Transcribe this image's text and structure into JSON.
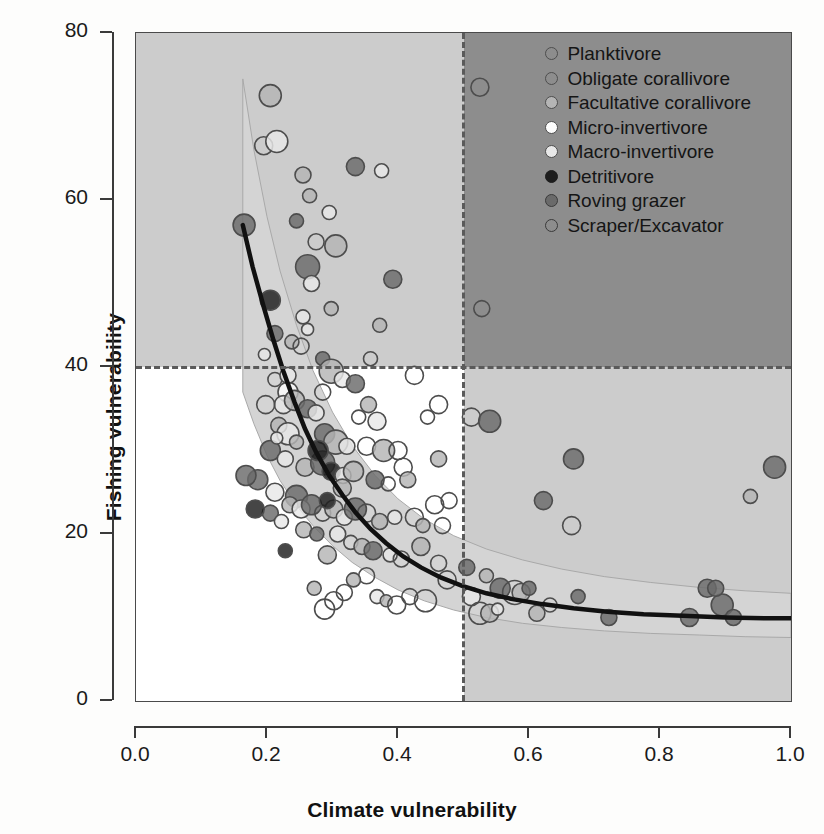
{
  "chart_data": {
    "type": "scatter",
    "title": "",
    "xlabel": "Climate vulnerability",
    "ylabel": "Fishing vulnerability",
    "xlim": [
      0.0,
      1.0
    ],
    "ylim": [
      0,
      80
    ],
    "xticks": [
      "0.0",
      "0.2",
      "0.4",
      "0.6",
      "0.8",
      "1.0"
    ],
    "xtick_values": [
      0.0,
      0.2,
      0.4,
      0.6,
      0.8,
      1.0
    ],
    "yticks": [
      "0",
      "20",
      "40",
      "60",
      "80"
    ],
    "ytick_values": [
      0,
      20,
      40,
      60,
      80
    ],
    "grid": false,
    "legend_position": "top-right",
    "annotations": {
      "threshold_x": 0.5,
      "threshold_y": 40,
      "quadrant_shading": {
        "top_left": "#cccccc",
        "top_right": "#8d8d8d",
        "bottom_left": "#ffffff",
        "bottom_right": "#cccccc"
      }
    },
    "fit_curve": {
      "name": "fitted trend",
      "color": "#111111",
      "points": [
        [
          0.163,
          57.0
        ],
        [
          0.178,
          52.0
        ],
        [
          0.195,
          47.2
        ],
        [
          0.21,
          43.2
        ],
        [
          0.225,
          39.5
        ],
        [
          0.242,
          35.8
        ],
        [
          0.258,
          32.6
        ],
        [
          0.275,
          29.8
        ],
        [
          0.295,
          27.0
        ],
        [
          0.315,
          24.7
        ],
        [
          0.335,
          22.6
        ],
        [
          0.358,
          20.6
        ],
        [
          0.382,
          18.9
        ],
        [
          0.408,
          17.3
        ],
        [
          0.435,
          16.0
        ],
        [
          0.465,
          14.8
        ],
        [
          0.498,
          13.8
        ],
        [
          0.535,
          12.9
        ],
        [
          0.575,
          12.2
        ],
        [
          0.62,
          11.6
        ],
        [
          0.668,
          11.1
        ],
        [
          0.72,
          10.7
        ],
        [
          0.775,
          10.4
        ],
        [
          0.835,
          10.2
        ],
        [
          0.9,
          10.0
        ],
        [
          0.965,
          9.9
        ],
        [
          1.0,
          9.9
        ]
      ]
    },
    "confidence_band": {
      "name": "95% confidence band",
      "color": "#d4d4d4",
      "upper": [
        [
          0.163,
          74.5
        ],
        [
          0.18,
          66.0
        ],
        [
          0.2,
          58.0
        ],
        [
          0.22,
          51.5
        ],
        [
          0.245,
          45.0
        ],
        [
          0.27,
          39.6
        ],
        [
          0.3,
          34.6
        ],
        [
          0.33,
          30.6
        ],
        [
          0.365,
          27.0
        ],
        [
          0.4,
          24.2
        ],
        [
          0.44,
          21.8
        ],
        [
          0.485,
          19.8
        ],
        [
          0.535,
          18.2
        ],
        [
          0.59,
          16.9
        ],
        [
          0.65,
          15.8
        ],
        [
          0.715,
          14.9
        ],
        [
          0.785,
          14.2
        ],
        [
          0.86,
          13.6
        ],
        [
          0.93,
          13.2
        ],
        [
          1.0,
          12.9
        ]
      ],
      "lower": [
        [
          1.0,
          7.6
        ],
        [
          0.93,
          7.7
        ],
        [
          0.86,
          7.9
        ],
        [
          0.785,
          8.1
        ],
        [
          0.715,
          8.4
        ],
        [
          0.65,
          8.8
        ],
        [
          0.59,
          9.3
        ],
        [
          0.535,
          10.0
        ],
        [
          0.485,
          10.9
        ],
        [
          0.44,
          12.0
        ],
        [
          0.4,
          13.3
        ],
        [
          0.365,
          14.8
        ],
        [
          0.33,
          16.6
        ],
        [
          0.3,
          18.6
        ],
        [
          0.27,
          21.0
        ],
        [
          0.245,
          23.4
        ],
        [
          0.22,
          26.4
        ],
        [
          0.2,
          29.4
        ],
        [
          0.18,
          33.2
        ],
        [
          0.163,
          37.0
        ]
      ]
    },
    "groups": [
      {
        "name": "Planktivore",
        "fill": "#ffffff",
        "stroke": "#4d4d4d"
      },
      {
        "name": "Obligate corallivore",
        "fill": "#f2f2f2",
        "stroke": "#4d4d4d"
      },
      {
        "name": "Facultative corallivore",
        "fill": "#b5b5b5",
        "stroke": "#4d4d4d"
      },
      {
        "name": "Micro-invertivore",
        "fill": "#fcfcfc",
        "stroke": "#4d4d4d"
      },
      {
        "name": "Macro-invertivore",
        "fill": "#e8e8e8",
        "stroke": "#4d4d4d"
      },
      {
        "name": "Detritivore",
        "fill": "#1d1d1d",
        "stroke": "#1d1d1d"
      },
      {
        "name": "Roving grazer",
        "fill": "#6a6a6a",
        "stroke": "#3a3a3a"
      },
      {
        "name": "Scraper/Excavator",
        "fill": "#ffffff",
        "stroke": "#3a3a3a"
      }
    ],
    "points": [
      [
        0.205,
        72.5,
        11,
        2
      ],
      [
        0.525,
        73.5,
        9,
        0
      ],
      [
        0.195,
        66.5,
        9,
        7
      ],
      [
        0.215,
        67.0,
        11,
        4
      ],
      [
        0.255,
        63.0,
        8,
        2
      ],
      [
        0.335,
        64.0,
        9,
        6
      ],
      [
        0.165,
        57.0,
        11,
        6
      ],
      [
        0.375,
        63.5,
        7,
        4
      ],
      [
        0.265,
        60.5,
        7,
        2
      ],
      [
        0.295,
        58.5,
        7,
        4
      ],
      [
        0.275,
        55.0,
        8,
        0
      ],
      [
        0.305,
        54.5,
        11,
        2
      ],
      [
        0.262,
        52.0,
        12,
        6
      ],
      [
        0.268,
        50.0,
        8,
        4
      ],
      [
        0.392,
        50.5,
        9,
        6
      ],
      [
        0.205,
        48.0,
        10,
        5
      ],
      [
        0.298,
        47.0,
        7,
        2
      ],
      [
        0.255,
        46.0,
        7,
        4
      ],
      [
        0.528,
        47.0,
        8,
        7
      ],
      [
        0.212,
        44.0,
        8,
        6
      ],
      [
        0.238,
        43.0,
        7,
        2
      ],
      [
        0.196,
        41.5,
        6,
        4
      ],
      [
        0.252,
        42.5,
        8,
        0
      ],
      [
        0.285,
        41.0,
        7,
        6
      ],
      [
        0.298,
        39.5,
        12,
        2
      ],
      [
        0.315,
        38.5,
        8,
        4
      ],
      [
        0.285,
        37.0,
        8,
        0
      ],
      [
        0.335,
        38.0,
        9,
        6
      ],
      [
        0.425,
        39.0,
        9,
        0
      ],
      [
        0.232,
        37.0,
        10,
        3
      ],
      [
        0.225,
        35.5,
        9,
        4
      ],
      [
        0.242,
        36.0,
        10,
        2
      ],
      [
        0.262,
        35.0,
        9,
        6
      ],
      [
        0.275,
        34.5,
        8,
        4
      ],
      [
        0.34,
        34.0,
        7,
        0
      ],
      [
        0.355,
        35.5,
        8,
        2
      ],
      [
        0.368,
        33.5,
        9,
        4
      ],
      [
        0.462,
        35.5,
        9,
        0
      ],
      [
        0.512,
        34.0,
        9,
        7
      ],
      [
        0.54,
        33.5,
        11,
        6
      ],
      [
        0.218,
        33.0,
        8,
        2
      ],
      [
        0.232,
        32.0,
        11,
        4
      ],
      [
        0.288,
        32.0,
        10,
        6
      ],
      [
        0.305,
        31.0,
        12,
        2
      ],
      [
        0.322,
        30.5,
        8,
        4
      ],
      [
        0.352,
        30.5,
        9,
        0
      ],
      [
        0.378,
        30.0,
        11,
        2
      ],
      [
        0.4,
        30.0,
        9,
        7
      ],
      [
        0.408,
        28.0,
        9,
        0
      ],
      [
        0.975,
        28.0,
        11,
        6
      ],
      [
        0.205,
        30.0,
        10,
        6
      ],
      [
        0.228,
        29.0,
        8,
        4
      ],
      [
        0.258,
        28.0,
        9,
        2
      ],
      [
        0.285,
        28.5,
        12,
        6
      ],
      [
        0.298,
        27.5,
        9,
        5
      ],
      [
        0.316,
        27.0,
        8,
        4
      ],
      [
        0.332,
        27.5,
        10,
        2
      ],
      [
        0.365,
        26.5,
        9,
        6
      ],
      [
        0.385,
        26.0,
        7,
        0
      ],
      [
        0.415,
        26.5,
        8,
        2
      ],
      [
        0.186,
        26.5,
        10,
        6
      ],
      [
        0.212,
        25.0,
        9,
        4
      ],
      [
        0.245,
        24.5,
        11,
        6
      ],
      [
        0.668,
        29.0,
        10,
        6
      ],
      [
        0.622,
        24.0,
        9,
        6
      ],
      [
        0.938,
        24.5,
        7,
        2
      ],
      [
        0.235,
        23.5,
        8,
        2
      ],
      [
        0.252,
        23.0,
        9,
        4
      ],
      [
        0.268,
        23.5,
        10,
        6
      ],
      [
        0.285,
        22.5,
        8,
        0
      ],
      [
        0.302,
        23.0,
        9,
        2
      ],
      [
        0.318,
        22.0,
        8,
        4
      ],
      [
        0.335,
        23.0,
        11,
        6
      ],
      [
        0.352,
        22.5,
        9,
        0
      ],
      [
        0.372,
        21.5,
        8,
        2
      ],
      [
        0.395,
        22.0,
        7,
        4
      ],
      [
        0.425,
        22.0,
        9,
        0
      ],
      [
        0.456,
        23.5,
        9,
        7
      ],
      [
        0.468,
        21.0,
        8,
        0
      ],
      [
        0.205,
        22.5,
        8,
        6
      ],
      [
        0.222,
        21.5,
        7,
        4
      ],
      [
        0.256,
        20.5,
        8,
        2
      ],
      [
        0.276,
        20.0,
        7,
        6
      ],
      [
        0.292,
        17.5,
        9,
        2
      ],
      [
        0.308,
        20.0,
        8,
        4
      ],
      [
        0.328,
        19.0,
        7,
        0
      ],
      [
        0.345,
        18.5,
        8,
        2
      ],
      [
        0.362,
        18.0,
        9,
        6
      ],
      [
        0.388,
        17.5,
        7,
        4
      ],
      [
        0.405,
        17.0,
        8,
        0
      ],
      [
        0.435,
        18.5,
        9,
        2
      ],
      [
        0.462,
        16.5,
        8,
        0
      ],
      [
        0.475,
        14.5,
        9,
        0
      ],
      [
        0.505,
        16.0,
        8,
        6
      ],
      [
        0.535,
        15.0,
        7,
        2
      ],
      [
        0.556,
        13.5,
        10,
        6
      ],
      [
        0.578,
        13.0,
        12,
        0
      ],
      [
        0.588,
        13.0,
        9,
        2
      ],
      [
        0.6,
        13.5,
        7,
        6
      ],
      [
        0.512,
        12.5,
        9,
        4
      ],
      [
        0.525,
        10.5,
        11,
        0
      ],
      [
        0.54,
        10.5,
        9,
        2
      ],
      [
        0.552,
        11.0,
        6,
        4
      ],
      [
        0.612,
        10.5,
        8,
        2
      ],
      [
        0.632,
        11.5,
        7,
        0
      ],
      [
        0.665,
        21.0,
        9,
        0
      ],
      [
        0.675,
        12.5,
        7,
        6
      ],
      [
        0.722,
        10.0,
        8,
        6
      ],
      [
        0.845,
        10.0,
        9,
        6
      ],
      [
        0.872,
        13.5,
        9,
        6
      ],
      [
        0.895,
        11.5,
        11,
        6
      ],
      [
        0.885,
        13.5,
        8,
        6
      ],
      [
        0.912,
        10.0,
        8,
        6
      ],
      [
        0.352,
        15.0,
        8,
        0
      ],
      [
        0.332,
        14.5,
        7,
        2
      ],
      [
        0.318,
        13.0,
        8,
        0
      ],
      [
        0.302,
        12.0,
        9,
        0
      ],
      [
        0.288,
        11.0,
        10,
        0
      ],
      [
        0.368,
        12.5,
        7,
        4
      ],
      [
        0.382,
        12.0,
        6,
        2
      ],
      [
        0.398,
        11.5,
        9,
        0
      ],
      [
        0.418,
        12.5,
        8,
        0
      ],
      [
        0.442,
        12.0,
        11,
        0
      ],
      [
        0.272,
        13.5,
        7,
        2
      ],
      [
        0.245,
        31.0,
        7,
        2
      ],
      [
        0.228,
        18.0,
        7,
        5
      ],
      [
        0.212,
        38.5,
        7,
        0
      ],
      [
        0.262,
        44.5,
        6,
        4
      ],
      [
        0.198,
        35.5,
        9,
        0
      ],
      [
        0.215,
        31.5,
        6,
        4
      ],
      [
        0.182,
        23.0,
        9,
        5
      ],
      [
        0.168,
        27.0,
        10,
        6
      ],
      [
        0.445,
        34.0,
        7,
        0
      ],
      [
        0.462,
        29.0,
        8,
        2
      ],
      [
        0.478,
        24.0,
        8,
        0
      ],
      [
        0.438,
        21.0,
        7,
        2
      ],
      [
        0.358,
        41.0,
        7,
        0
      ],
      [
        0.372,
        45.0,
        7,
        2
      ],
      [
        0.245,
        57.5,
        7,
        6
      ],
      [
        0.232,
        39.0,
        8,
        4
      ],
      [
        0.292,
        24.0,
        8,
        5
      ],
      [
        0.315,
        25.5,
        9,
        2
      ],
      [
        0.278,
        30.0,
        10,
        5
      ]
    ]
  },
  "legend": {
    "items": [
      "Planktivore",
      "Obligate corallivore",
      "Facultative corallivore",
      "Micro-invertivore",
      "Macro-invertivore",
      "Detritivore",
      "Roving grazer",
      "Scraper/Excavator"
    ]
  },
  "axes": {
    "x_title": "Climate vulnerability",
    "y_title": "Fishing vulnerability"
  }
}
